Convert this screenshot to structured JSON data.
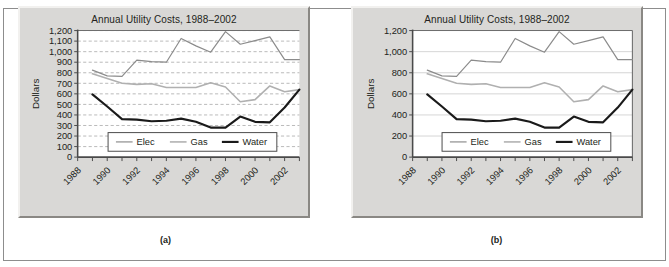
{
  "figure": {
    "top_partial_text": "",
    "captions": {
      "a": "(a)",
      "b": "(b)"
    }
  },
  "chart_data": [
    {
      "id": "a",
      "type": "line",
      "title": "Annual Utility Costs, 1988–2002",
      "xlabel": "",
      "ylabel": "Dollars",
      "caption": "(a)",
      "x": [
        1989,
        1990,
        1991,
        1992,
        1993,
        1994,
        1995,
        1996,
        1997,
        1998,
        1999,
        2000,
        2001,
        2002,
        2003
      ],
      "xtick_labels": [
        "1988",
        "1990",
        "1992",
        "1994",
        "1996",
        "1998",
        "2000",
        "2002"
      ],
      "xtick_values": [
        1988,
        1990,
        1992,
        1994,
        1996,
        1998,
        2000,
        2002
      ],
      "ytick_labels": [
        "0",
        "100",
        "200",
        "300",
        "400",
        "500",
        "600",
        "700",
        "800",
        "900",
        "1,000",
        "1,100",
        "1,200"
      ],
      "ylim": [
        0,
        1200
      ],
      "ytick_step": 100,
      "grid": "dashed-horizontal",
      "legend_position": "inside-bottom-center",
      "series": [
        {
          "name": "Elec",
          "color": "#8b8b8b",
          "width": 1.2,
          "values": [
            825,
            770,
            765,
            920,
            905,
            900,
            1125,
            1055,
            995,
            1190,
            1070,
            1105,
            1140,
            925,
            925
          ]
        },
        {
          "name": "Gas",
          "color": "#b0b0b0",
          "width": 1.6,
          "values": [
            790,
            745,
            700,
            690,
            695,
            660,
            660,
            660,
            705,
            665,
            525,
            545,
            675,
            620,
            640
          ]
        },
        {
          "name": "Water",
          "color": "#1a1a1a",
          "width": 2.2,
          "values": [
            595,
            480,
            360,
            355,
            340,
            345,
            365,
            335,
            280,
            280,
            385,
            335,
            330,
            470,
            640
          ]
        }
      ]
    },
    {
      "id": "b",
      "type": "line",
      "title": "Annual Utility Costs, 1988–2002",
      "xlabel": "",
      "ylabel": "Dollars",
      "caption": "(b)",
      "x": [
        1989,
        1990,
        1991,
        1992,
        1993,
        1994,
        1995,
        1996,
        1997,
        1998,
        1999,
        2000,
        2001,
        2002,
        2003
      ],
      "xtick_labels": [
        "1988",
        "1990",
        "1992",
        "1994",
        "1996",
        "1998",
        "2000",
        "2002"
      ],
      "xtick_values": [
        1988,
        1990,
        1992,
        1994,
        1996,
        1998,
        2000,
        2002
      ],
      "ytick_labels": [
        "0",
        "200",
        "400",
        "600",
        "800",
        "1,000",
        "1,200"
      ],
      "ylim": [
        0,
        1200
      ],
      "ytick_step": 200,
      "grid": "solid-horizontal",
      "legend_position": "inside-bottom-center",
      "series": [
        {
          "name": "Elec",
          "color": "#8b8b8b",
          "width": 1.2,
          "values": [
            825,
            770,
            765,
            920,
            905,
            900,
            1125,
            1055,
            995,
            1190,
            1070,
            1105,
            1140,
            925,
            925
          ]
        },
        {
          "name": "Gas",
          "color": "#b0b0b0",
          "width": 1.6,
          "values": [
            790,
            745,
            700,
            690,
            695,
            660,
            660,
            660,
            705,
            665,
            525,
            545,
            675,
            620,
            640
          ]
        },
        {
          "name": "Water",
          "color": "#1a1a1a",
          "width": 2.2,
          "values": [
            595,
            480,
            360,
            355,
            340,
            345,
            365,
            335,
            280,
            280,
            385,
            335,
            330,
            470,
            640
          ]
        }
      ]
    }
  ]
}
